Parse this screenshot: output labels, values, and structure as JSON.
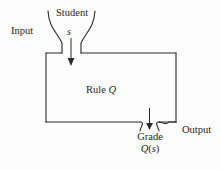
{
  "figure": {
    "type": "flow-diagram",
    "title_text": "",
    "background_color": "#fdfdfd",
    "stroke_color": "#2a2a2a",
    "box": {
      "label_prefix": "Rule",
      "label_variable": "Q",
      "label_full": "Rule Q"
    },
    "input": {
      "side_label": "Input",
      "source_label": "Student",
      "variable": "s",
      "arrow_direction": "down"
    },
    "output": {
      "side_label": "Output",
      "result_label": "Grade",
      "expression": "Q(s)",
      "expression_function": "Q",
      "expression_argument": "s",
      "arrow_direction": "down"
    }
  }
}
